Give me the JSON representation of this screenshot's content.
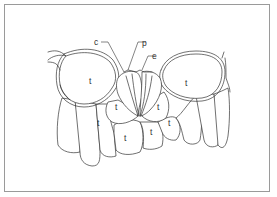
{
  "figure": {
    "type": "line-drawing",
    "stroke_color": "#333333",
    "frame_color": "#9a9a9a",
    "background": "#ffffff"
  },
  "callouts": [
    {
      "id": "c",
      "label": "c"
    },
    {
      "id": "p",
      "label": "p"
    },
    {
      "id": "e",
      "label": "e"
    }
  ],
  "regions": [
    {
      "id": "t1",
      "label": "t"
    },
    {
      "id": "t2",
      "label": "t"
    },
    {
      "id": "t3",
      "label": "t"
    },
    {
      "id": "t4",
      "label": "t"
    },
    {
      "id": "t5",
      "label": "t"
    },
    {
      "id": "t6",
      "label": "t"
    },
    {
      "id": "t7",
      "label": "t"
    },
    {
      "id": "t8",
      "label": "t"
    },
    {
      "id": "t9",
      "label": "t"
    }
  ]
}
